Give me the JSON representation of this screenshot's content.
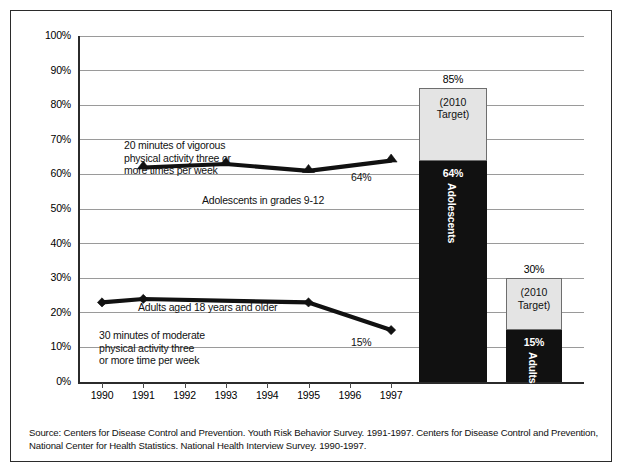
{
  "chart_data": {
    "type": "line",
    "title": "",
    "xlabel": "",
    "ylabel": "",
    "xlim": [
      1989.5,
      1997.8
    ],
    "ylim": [
      0,
      100
    ],
    "grid": true,
    "legend_position": "inline-annotations",
    "x_tick_labels": [
      "1990",
      "1991",
      "1992",
      "1993",
      "1994",
      "1995",
      "1996",
      "1997"
    ],
    "y_tick_labels": [
      "0%",
      "10%",
      "20%",
      "30%",
      "40%",
      "50%",
      "60%",
      "70%",
      "80%",
      "90%",
      "100%"
    ],
    "y_ticks": [
      0,
      10,
      20,
      30,
      40,
      50,
      60,
      70,
      80,
      90,
      100
    ],
    "series": [
      {
        "name": "Adolescents in grades 9-12",
        "marker": "triangle",
        "x": [
          1991,
          1993,
          1995,
          1997
        ],
        "values": [
          62,
          63,
          61,
          64
        ],
        "end_label": "64%"
      },
      {
        "name": "Adults aged 18 years and older",
        "marker": "diamond",
        "x": [
          1990,
          1991,
          1995,
          1997
        ],
        "values": [
          23,
          24,
          23,
          15
        ],
        "end_label": "15%"
      }
    ],
    "annotations": [
      {
        "id": "vigorous-activity-note",
        "text": "20 minutes of vigorous\nphysical activity three or\nmore times per week"
      },
      {
        "id": "moderate-activity-note",
        "text": "30 minutes of moderate\nphysical activity three\nor more time per week"
      }
    ],
    "bars": [
      {
        "id": "adolescents",
        "total_label": "85%",
        "total": 85,
        "current": 64,
        "current_label": "64%",
        "target_text": "(2010\nTarget)",
        "rotated_label": "Adolescents"
      },
      {
        "id": "adults",
        "total_label": "30%",
        "total": 30,
        "current": 15,
        "current_label": "15%",
        "target_text": "(2010\nTarget)",
        "rotated_label": "Adults"
      }
    ],
    "colors": {
      "filled": "#111111",
      "target": "#e4e4e4",
      "grid": "#9a9a9a",
      "axis": "#2b2b2b"
    }
  },
  "source": {
    "text": "Source:  Centers for Disease Control and Prevention. Youth Risk Behavior Survey. 1991-1997.  Centers for Disease Control and Prevention, National Center for Health Statistics. National Health Interview Survey. 1990-1997."
  }
}
